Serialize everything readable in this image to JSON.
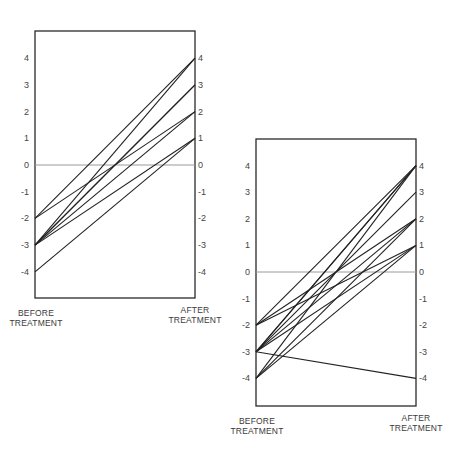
{
  "chart_data": [
    {
      "type": "line",
      "subtype": "paired-slope",
      "title": "",
      "xlabel_left": [
        "BEFORE",
        "TREATMENT"
      ],
      "xlabel_right": [
        "AFTER",
        "TREATMENT"
      ],
      "yticks": [
        4,
        3,
        2,
        1,
        0,
        -1,
        -2,
        -3,
        -4
      ],
      "ylim": [
        -5,
        5
      ],
      "reference_line": 0,
      "pairs": [
        {
          "before": -2,
          "after": 4
        },
        {
          "before": -2,
          "after": 2
        },
        {
          "before": -3,
          "after": 4
        },
        {
          "before": -3,
          "after": 3
        },
        {
          "before": -3,
          "after": 3
        },
        {
          "before": -3,
          "after": 2
        },
        {
          "before": -3,
          "after": 1
        },
        {
          "before": -4,
          "after": 1
        }
      ],
      "layout": {
        "left": 35,
        "right": 195,
        "top": 31,
        "bottom": 298,
        "zeroY": 165,
        "unit": 26.7
      }
    },
    {
      "type": "line",
      "subtype": "paired-slope",
      "title": "",
      "xlabel_left": [
        "BEFORE",
        "TREATMENT"
      ],
      "xlabel_right": [
        "AFTER",
        "TREATMENT"
      ],
      "yticks": [
        4,
        3,
        2,
        1,
        0,
        -1,
        -2,
        -3,
        -4
      ],
      "ylim": [
        -5,
        5
      ],
      "reference_line": 0,
      "pairs": [
        {
          "before": -2,
          "after": 4
        },
        {
          "before": -2,
          "after": 2
        },
        {
          "before": -2,
          "after": 1
        },
        {
          "before": -3,
          "after": 4
        },
        {
          "before": -3,
          "after": 4
        },
        {
          "before": -3,
          "after": 3
        },
        {
          "before": -3,
          "after": 2
        },
        {
          "before": -3,
          "after": 1
        },
        {
          "before": -3,
          "after": -4
        },
        {
          "before": -4,
          "after": 4
        },
        {
          "before": -4,
          "after": 2
        },
        {
          "before": -4,
          "after": 1
        }
      ],
      "layout": {
        "left": 256,
        "right": 416,
        "top": 139,
        "bottom": 406,
        "zeroY": 272,
        "unit": 26.6
      }
    }
  ]
}
